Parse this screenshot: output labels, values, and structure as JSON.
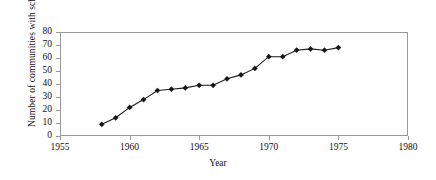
{
  "chart_data": {
    "type": "line",
    "title": "",
    "xlabel": "Year",
    "ylabel": "Number of communities with schools",
    "xlim": [
      1955,
      1980
    ],
    "ylim": [
      0,
      80
    ],
    "xticks": [
      1955,
      1960,
      1965,
      1970,
      1975,
      1980
    ],
    "yticks": [
      0,
      10,
      20,
      30,
      40,
      50,
      60,
      70,
      80
    ],
    "grid": false,
    "legend": null,
    "marker": "diamond",
    "line_color": "#1a1a1a",
    "marker_color": "#141414",
    "frame_color": "#9a9a9a",
    "x": [
      1958,
      1959,
      1960,
      1961,
      1962,
      1963,
      1964,
      1965,
      1966,
      1967,
      1968,
      1969,
      1970,
      1971,
      1972,
      1973,
      1974,
      1975
    ],
    "values": [
      9,
      14,
      22,
      28,
      35,
      36,
      37,
      39,
      39,
      44,
      47,
      52,
      61,
      61,
      66,
      67,
      66,
      68
    ],
    "series": [
      {
        "name": "Communities with schools",
        "values": [
          9,
          14,
          22,
          28,
          35,
          36,
          37,
          39,
          39,
          44,
          47,
          52,
          61,
          61,
          66,
          67,
          66,
          68
        ]
      }
    ]
  }
}
